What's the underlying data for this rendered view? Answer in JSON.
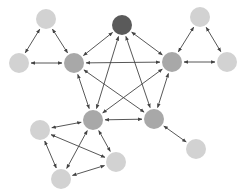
{
  "diagram": {
    "type": "network",
    "colors": {
      "hub": "#5a5a5a",
      "core": "#a8a8a8",
      "leaf": "#d2d2d2",
      "edge": "#444444"
    },
    "nodes": [
      {
        "id": "hub",
        "x": 122,
        "y": 25,
        "r": 10,
        "kind": "hub"
      },
      {
        "id": "core-left",
        "x": 74,
        "y": 63,
        "r": 10,
        "kind": "core"
      },
      {
        "id": "core-right",
        "x": 172,
        "y": 62,
        "r": 10,
        "kind": "core"
      },
      {
        "id": "core-bottom-left",
        "x": 93,
        "y": 120,
        "r": 10,
        "kind": "core"
      },
      {
        "id": "core-bottom-right",
        "x": 154,
        "y": 119,
        "r": 10,
        "kind": "core"
      },
      {
        "id": "leaf-top-left",
        "x": 46,
        "y": 19,
        "r": 10,
        "kind": "leaf"
      },
      {
        "id": "leaf-left",
        "x": 19,
        "y": 63,
        "r": 10,
        "kind": "leaf"
      },
      {
        "id": "leaf-top-right",
        "x": 200,
        "y": 17,
        "r": 10,
        "kind": "leaf"
      },
      {
        "id": "leaf-right",
        "x": 227,
        "y": 62,
        "r": 10,
        "kind": "leaf"
      },
      {
        "id": "leaf-lower-left",
        "x": 40,
        "y": 130,
        "r": 10,
        "kind": "leaf"
      },
      {
        "id": "leaf-bottom",
        "x": 61,
        "y": 179,
        "r": 10,
        "kind": "leaf"
      },
      {
        "id": "leaf-lower-mid",
        "x": 116,
        "y": 162,
        "r": 10,
        "kind": "leaf"
      },
      {
        "id": "leaf-lower-right",
        "x": 196,
        "y": 149,
        "r": 10,
        "kind": "leaf"
      }
    ],
    "edges": [
      {
        "from": "hub",
        "to": "core-left"
      },
      {
        "from": "hub",
        "to": "core-right"
      },
      {
        "from": "hub",
        "to": "core-bottom-left"
      },
      {
        "from": "hub",
        "to": "core-bottom-right"
      },
      {
        "from": "core-left",
        "to": "core-right"
      },
      {
        "from": "core-left",
        "to": "core-bottom-left"
      },
      {
        "from": "core-left",
        "to": "core-bottom-right"
      },
      {
        "from": "core-right",
        "to": "core-bottom-left"
      },
      {
        "from": "core-right",
        "to": "core-bottom-right"
      },
      {
        "from": "core-bottom-left",
        "to": "core-bottom-right"
      },
      {
        "from": "leaf-top-left",
        "to": "leaf-left"
      },
      {
        "from": "leaf-top-left",
        "to": "core-left"
      },
      {
        "from": "leaf-left",
        "to": "core-left"
      },
      {
        "from": "leaf-top-right",
        "to": "core-right"
      },
      {
        "from": "leaf-top-right",
        "to": "leaf-right"
      },
      {
        "from": "core-right",
        "to": "leaf-right"
      },
      {
        "from": "leaf-lower-left",
        "to": "core-bottom-left"
      },
      {
        "from": "leaf-lower-left",
        "to": "leaf-bottom"
      },
      {
        "from": "leaf-lower-left",
        "to": "leaf-lower-mid"
      },
      {
        "from": "leaf-bottom",
        "to": "core-bottom-left"
      },
      {
        "from": "leaf-bottom",
        "to": "leaf-lower-mid"
      },
      {
        "from": "core-bottom-left",
        "to": "leaf-lower-mid"
      },
      {
        "from": "core-bottom-right",
        "to": "leaf-lower-right"
      }
    ]
  }
}
